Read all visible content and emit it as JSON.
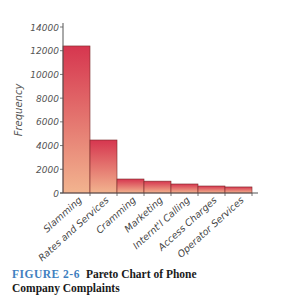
{
  "chart_data": {
    "type": "bar",
    "xlabel": "",
    "ylabel": "Frequency",
    "ylim": [
      0,
      14000
    ],
    "yticks": [
      0,
      2000,
      4000,
      6000,
      8000,
      10000,
      12000,
      14000
    ],
    "grid": false,
    "legend": null,
    "categories": [
      "Slamming",
      "Rates and Services",
      "Cramming",
      "Marketing",
      "Internt'l Calling",
      "Access Charges",
      "Operator Services"
    ],
    "values": [
      12400,
      4470,
      1180,
      1000,
      760,
      590,
      510
    ],
    "bar_color_top": "#d6364f",
    "bar_color_bottom": "#f2b48f"
  },
  "caption": {
    "figure_label": "FIGURE 2-6",
    "title_line1": "Pareto Chart of Phone",
    "title_line2": "Company Complaints"
  }
}
